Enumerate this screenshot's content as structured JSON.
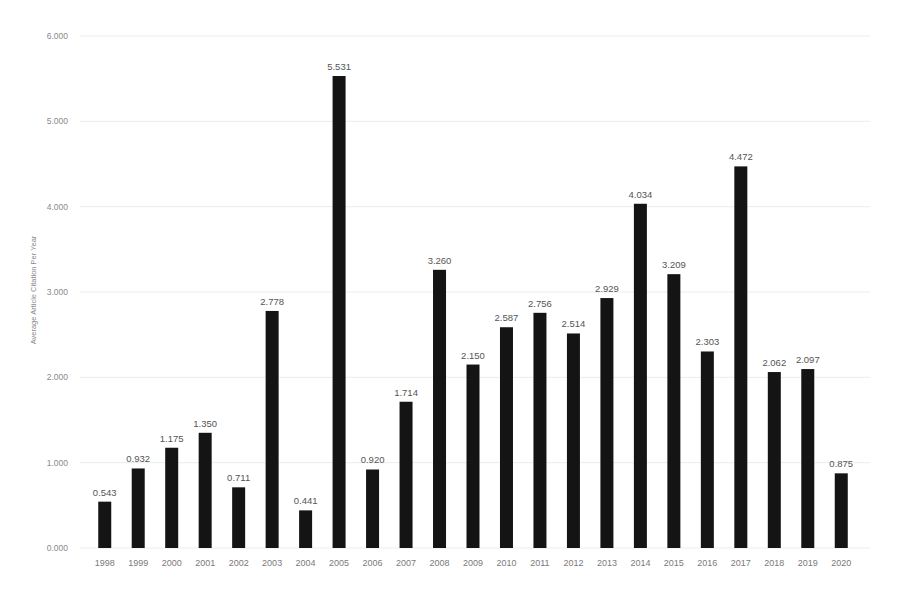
{
  "chart_data": {
    "type": "bar",
    "title": "",
    "xlabel": "",
    "ylabel": "Average Article Citation Per Year",
    "ylim": [
      0,
      6
    ],
    "yticks": [
      "0.000",
      "1.000",
      "2.000",
      "3.000",
      "4.000",
      "5.000",
      "6.000"
    ],
    "grid": true,
    "legend": null,
    "categories": [
      "1998",
      "1999",
      "2000",
      "2001",
      "2002",
      "2003",
      "2004",
      "2005",
      "2006",
      "2007",
      "2008",
      "2009",
      "2010",
      "2011",
      "2012",
      "2013",
      "2014",
      "2015",
      "2016",
      "2017",
      "2018",
      "2019",
      "2020"
    ],
    "values": [
      0.543,
      0.932,
      1.175,
      1.35,
      0.711,
      2.778,
      0.441,
      5.531,
      0.92,
      1.714,
      3.26,
      2.15,
      2.587,
      2.756,
      2.514,
      2.929,
      4.034,
      3.209,
      2.303,
      4.472,
      2.062,
      2.097,
      0.875
    ],
    "data_labels": [
      "0.543",
      "0.932",
      "1.175",
      "1.350",
      "0.711",
      "2.778",
      "0.441",
      "5.531",
      "0.920",
      "1.714",
      "3.260",
      "2.150",
      "2.587",
      "2.756",
      "2.514",
      "2.929",
      "4.034",
      "3.209",
      "2.303",
      "4.472",
      "2.062",
      "2.097",
      "0.875"
    ],
    "bar_color": "#141414",
    "gridline_color": "#ececec"
  }
}
